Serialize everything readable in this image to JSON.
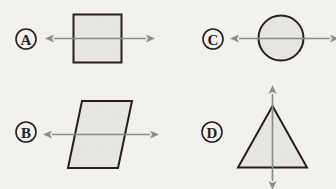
{
  "figure": {
    "background_color": "#f2f1ed",
    "shape_fill_color": "#e6e5e1",
    "shape_stroke_color": "#231f20",
    "symmetry_line_color": "#8d8d8d",
    "options": [
      {
        "key": "A",
        "label": "A",
        "shape_name": "square",
        "symmetry_line_orientation": "horizontal"
      },
      {
        "key": "B",
        "label": "B",
        "shape_name": "parallelogram",
        "symmetry_line_orientation": "horizontal"
      },
      {
        "key": "C",
        "label": "C",
        "shape_name": "circle",
        "symmetry_line_orientation": "horizontal"
      },
      {
        "key": "D",
        "label": "D",
        "shape_name": "triangle",
        "symmetry_line_orientation": "vertical"
      }
    ]
  }
}
